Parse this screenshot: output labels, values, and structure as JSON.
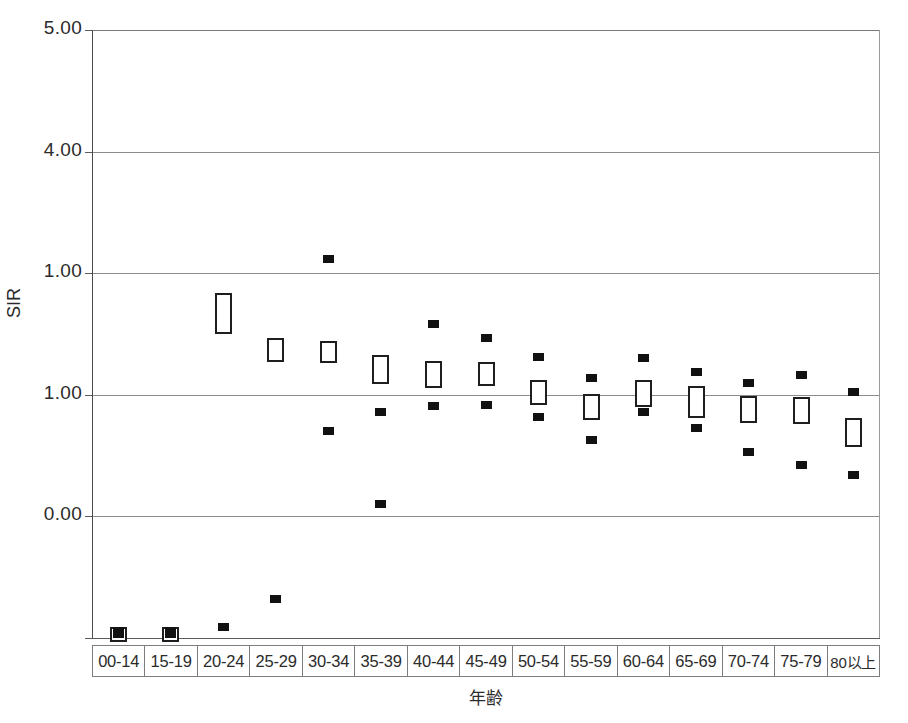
{
  "figure": {
    "partial_title": "",
    "y_axis_title": "SIR",
    "x_axis_title": "年齢"
  },
  "y_axis": {
    "tick_labels": [
      "5.00",
      "4.00",
      "1.00",
      "1.00",
      "0.00"
    ],
    "tick_values": [
      5.0,
      4.0,
      3.0,
      2.0,
      0.0
    ]
  },
  "chart_data": {
    "type": "scatter",
    "title": "",
    "xlabel": "年齢",
    "ylabel": "SIR",
    "ylim": [
      0.0,
      5.0
    ],
    "yticks": [
      0.0,
      2.0,
      3.0,
      4.0,
      5.0
    ],
    "ytick_labels": [
      "0.00",
      "1.00",
      "1.00",
      "4.00",
      "5.00"
    ],
    "grid": true,
    "legend_position": "none",
    "categories": [
      "00-14",
      "15-19",
      "20-24",
      "25-29",
      "30-34",
      "35-39",
      "40-44",
      "45-49",
      "50-54",
      "55-59",
      "60-64",
      "65-69",
      "70-74",
      "75-79",
      "80以上"
    ],
    "series": [
      {
        "name": "upper limit",
        "marker": "filled-square",
        "values": [
          0.06,
          0.06,
          0.09,
          0.32,
          3.12,
          1.1,
          2.58,
          2.47,
          2.31,
          2.14,
          2.3,
          2.19,
          2.1,
          2.16,
          2.02
        ]
      },
      {
        "name": "point estimate box",
        "marker": "open-rectangle",
        "values": [
          0.03,
          0.03,
          2.67,
          2.37,
          2.35,
          2.21,
          2.17,
          2.17,
          2.02,
          1.9,
          2.01,
          1.94,
          1.88,
          1.87,
          1.69
        ],
        "box_low": [
          -0.03,
          -0.03,
          2.5,
          2.27,
          2.26,
          2.09,
          2.06,
          2.07,
          1.92,
          1.79,
          1.9,
          1.81,
          1.77,
          1.76,
          1.57
        ],
        "box_high": [
          0.09,
          0.09,
          2.84,
          2.47,
          2.44,
          2.33,
          2.28,
          2.27,
          2.12,
          2.01,
          2.12,
          2.07,
          1.99,
          1.98,
          1.81
        ]
      },
      {
        "name": "lower limit",
        "marker": "filled-square",
        "values": [
          0.03,
          0.03,
          0.09,
          0.32,
          1.7,
          1.86,
          1.91,
          1.92,
          1.82,
          1.63,
          1.86,
          1.73,
          1.53,
          1.42,
          1.34
        ]
      }
    ]
  },
  "geometry": {
    "plot_left": 92,
    "plot_top": 30,
    "plot_width": 788,
    "plot_height": 608,
    "y_top_value": 5.0,
    "y_bottom_value": 0.0,
    "px_per_unit": 121.6,
    "gridline_y": [
      30,
      152,
      273,
      395,
      516,
      638
    ],
    "zero_y": 638
  }
}
